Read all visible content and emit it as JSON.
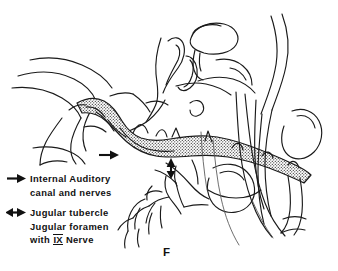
{
  "figure": {
    "panel_letter": "F",
    "type": "anatomical line drawing",
    "ink_color": "#1a1a1a",
    "background_color": "#ffffff"
  },
  "legend": {
    "items": [
      {
        "marker": "single-right-arrow",
        "marker_glyph": "→",
        "lines": [
          "Internal Auditory",
          "canal and nerves"
        ]
      },
      {
        "marker": "double-headed-arrow",
        "marker_glyph": "↔",
        "lines": [
          "Jugular tubercle",
          "Jugular foramen",
          "with IX Nerve"
        ],
        "roman_numeral": "IX"
      }
    ]
  },
  "callouts": [
    {
      "name": "internal-auditory-canal-pointer",
      "direction": "right",
      "style": "single-headed",
      "points_to": "Internal Auditory canal and nerves"
    },
    {
      "name": "jugular-tubercle-pointer",
      "direction": "up",
      "style": "double-headed",
      "points_to": "Jugular tubercle / Jugular foramen"
    }
  ]
}
